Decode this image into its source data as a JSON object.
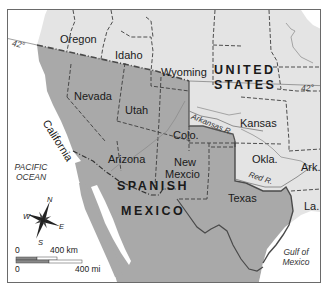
{
  "map": {
    "colors": {
      "us_land": "#e4e4e4",
      "spanish_mexico_land": "#a9a9a9",
      "water": "#ffffff",
      "border_dash": "#3c3c3c",
      "international_border": "#555555",
      "frame": "#6a6a6a"
    },
    "regions": {
      "us": {
        "line1": "UNITED",
        "line2": "STATES"
      },
      "spanish_mexico": {
        "line1": "SPANISH",
        "line2": "MEXICO"
      }
    },
    "states": {
      "oregon": "Oregon",
      "idaho": "Idaho",
      "wyoming": "Wyoming",
      "nevada": "Nevada",
      "utah": "Utah",
      "california": "California",
      "colorado": "Colo.",
      "kansas": "Kansas",
      "arizona": "Arizona",
      "new_mexico_line1": "New",
      "new_mexico_line2": "Mexcio",
      "oklahoma": "Okla.",
      "arkansas": "Ark.",
      "texas": "Texas",
      "louisiana": "La."
    },
    "water_bodies": {
      "pacific_line1": "PACIFIC",
      "pacific_line2": "OCEAN",
      "gulf_line1": "Gulf of",
      "gulf_line2": "Mexico"
    },
    "rivers": {
      "arkansas": "Arkansas R.",
      "red": "Red R."
    },
    "latitude": {
      "left": "42°",
      "right": "42°"
    },
    "compass": {
      "n": "N",
      "s": "S",
      "e": "E",
      "w": "W"
    },
    "scale": {
      "km_zero": "0",
      "km_label": "400 km",
      "mi_zero": "0",
      "mi_label": "400 mi"
    }
  }
}
